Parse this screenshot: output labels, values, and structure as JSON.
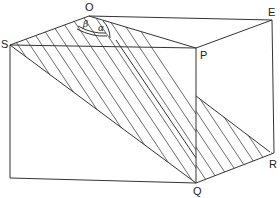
{
  "diagram": {
    "type": "geometry-cuboid-with-inclined-plane",
    "points": {
      "O": "O",
      "E": "E",
      "S": "S",
      "P": "P",
      "Q": "Q",
      "R": "R"
    },
    "angles": {
      "alpha": "α",
      "beta": "β"
    },
    "colors": {
      "line": "#333333",
      "hatch": "#444444",
      "background": "#ffffff"
    }
  }
}
